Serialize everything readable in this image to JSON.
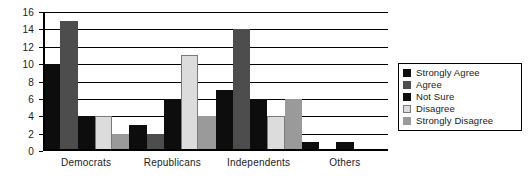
{
  "chart_data": {
    "type": "bar",
    "title": "",
    "xlabel": "",
    "ylabel": "",
    "ylim": [
      0,
      16
    ],
    "ytick_step": 2,
    "yticks": [
      16,
      14,
      12,
      10,
      8,
      6,
      4,
      2,
      0
    ],
    "grid": true,
    "legend_position": "right",
    "categories": [
      "Democrats",
      "Republicans",
      "Independents",
      "Others"
    ],
    "series": [
      {
        "name": "Strongly Agree",
        "color": "#0d0d0d",
        "values": [
          10,
          3,
          7,
          1
        ]
      },
      {
        "name": "Agree",
        "color": "#4d4d4d",
        "values": [
          15,
          2,
          14,
          0
        ]
      },
      {
        "name": "Not Sure",
        "color": "#0d0d0d",
        "values": [
          4,
          6,
          6,
          1
        ]
      },
      {
        "name": "Disagree",
        "color": "#dcdcdc",
        "values": [
          4,
          11,
          4,
          0
        ]
      },
      {
        "name": "Strongly Disagree",
        "color": "#9a9a9a",
        "values": [
          2,
          4,
          6,
          0
        ]
      }
    ]
  }
}
